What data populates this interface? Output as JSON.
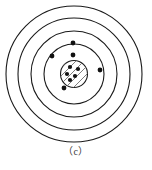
{
  "figure": {
    "name": "bohr-atom-model",
    "caption": "（c）",
    "background_color": "#ffffff",
    "stroke_color": "#1a1a1a",
    "nucleus_fill": "#ffffff",
    "hatch_color": "#6e6e6e",
    "electron_color": "#111111",
    "center": {
      "x": 74,
      "y": 74
    },
    "shells": [
      {
        "label": "shell-4-outer",
        "radius": 68,
        "stroke_width": 1.1
      },
      {
        "label": "shell-3",
        "radius": 56,
        "stroke_width": 1.1
      },
      {
        "label": "shell-2",
        "radius": 43,
        "stroke_width": 1.1
      },
      {
        "label": "shell-1-inner",
        "radius": 30,
        "stroke_width": 1.1
      }
    ],
    "nucleus": {
      "label": "nucleus",
      "radius": 13.5,
      "stroke_width": 1.1,
      "hatch_angle_deg": 45,
      "hatch_spacing": 4,
      "particles": [
        {
          "x": 70,
          "y": 67,
          "r": 2.1
        },
        {
          "x": 78,
          "y": 69,
          "r": 2.1
        },
        {
          "x": 67,
          "y": 74,
          "r": 2.1
        },
        {
          "x": 75,
          "y": 76,
          "r": 2.1
        },
        {
          "x": 70,
          "y": 80,
          "r": 2.1
        }
      ],
      "particle_count": 5
    },
    "electrons": [
      {
        "name": "electron-shell2-top",
        "x": 73,
        "y": 43,
        "r": 2.4,
        "shell": 2
      },
      {
        "name": "electron-shell1-top",
        "x": 73,
        "y": 55,
        "r": 2.4,
        "shell": 1
      },
      {
        "name": "electron-shell2-left",
        "x": 52,
        "y": 56,
        "r": 2.4,
        "shell": 2
      },
      {
        "name": "electron-shell1-bottomleft",
        "x": 64,
        "y": 88,
        "r": 2.4,
        "shell": 1
      },
      {
        "name": "electron-shell3-right",
        "x": 100,
        "y": 70,
        "r": 2.4,
        "shell": 3
      }
    ],
    "electron_count": 5
  },
  "chart_data": {
    "type": "diagram",
    "title": "（c）",
    "shell_radii": [
      30,
      43,
      56,
      68
    ],
    "nucleus_radius": 13.5,
    "electrons_per_shell": {
      "1": 2,
      "2": 2,
      "3": 1,
      "4": 0
    },
    "nucleus_particles": 5
  }
}
